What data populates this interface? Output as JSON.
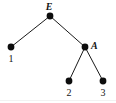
{
  "figure": {
    "kind": "tree-diagram",
    "width": 116,
    "height": 103,
    "background_color": "#ffffff",
    "node_color": "#0d0d0d",
    "edge_color": "#1a1a1a",
    "label_color": "#141414"
  },
  "nodes": [
    {
      "id": "E",
      "label": "E",
      "role": "root",
      "label_style": "bold-italic",
      "x": 50,
      "y": 16,
      "radius": 3.4,
      "label_x": 49,
      "label_y": 2,
      "label_anchor": "above"
    },
    {
      "id": "1",
      "label": "1",
      "role": "leaf",
      "label_style": "roman",
      "x": 11,
      "y": 47,
      "radius": 3.4,
      "label_x": 11,
      "label_y": 54,
      "label_anchor": "below"
    },
    {
      "id": "A",
      "label": "A",
      "role": "internal",
      "label_style": "bold-italic",
      "x": 85,
      "y": 47,
      "radius": 3.4,
      "label_x": 91,
      "label_y": 41,
      "label_anchor": "right"
    },
    {
      "id": "2",
      "label": "2",
      "role": "leaf",
      "label_style": "roman",
      "x": 69,
      "y": 81,
      "radius": 3.4,
      "label_x": 69,
      "label_y": 88,
      "label_anchor": "below"
    },
    {
      "id": "3",
      "label": "3",
      "role": "leaf",
      "label_style": "roman",
      "x": 103,
      "y": 81,
      "radius": 3.4,
      "label_x": 103,
      "label_y": 88,
      "label_anchor": "below"
    }
  ],
  "edges": [
    {
      "from": "E",
      "to": "1",
      "x1": 50,
      "y1": 16,
      "x2": 11,
      "y2": 47
    },
    {
      "from": "E",
      "to": "A",
      "x1": 50,
      "y1": 16,
      "x2": 85,
      "y2": 47
    },
    {
      "from": "A",
      "to": "2",
      "x1": 85,
      "y1": 47,
      "x2": 69,
      "y2": 81
    },
    {
      "from": "A",
      "to": "3",
      "x1": 85,
      "y1": 47,
      "x2": 103,
      "y2": 81
    }
  ]
}
